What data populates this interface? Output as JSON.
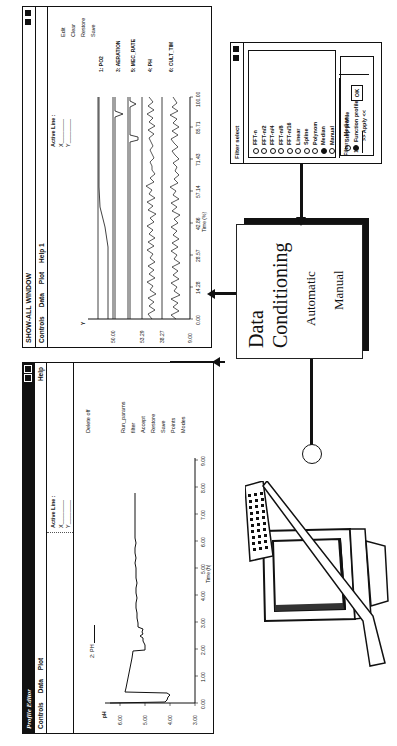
{
  "profile_editor": {
    "title": "Profile Editor",
    "menu": [
      "Controls",
      "Data",
      "Plot"
    ],
    "help": "Help",
    "trace_label": "2: PH",
    "active_line_label": "Active Line :",
    "x_label": "X",
    "y_label": "Y",
    "delete_label": "Delete off",
    "side_buttons": [
      "Run_params",
      "filter",
      "Accept",
      "Restore",
      "Save",
      "Points",
      "Modes"
    ],
    "y_axis_label": "pH",
    "y_ticks": [
      "3.00",
      "4.00",
      "5.00",
      "6.00"
    ],
    "x_ticks": [
      "0.00",
      "1.00",
      "2.00",
      "3.00",
      "4.00",
      "5.00",
      "6.00",
      "7.00",
      "8.00",
      "9.00"
    ],
    "x_axis_label": "Time (h)"
  },
  "show_all_window": {
    "title": "SHOW-ALL WINDOW",
    "menu": [
      "Controls",
      "Data",
      "Plot",
      "Help 1"
    ],
    "active_line_label": "Active Line :",
    "x_label": "X",
    "y_label": "Y",
    "side_buttons": [
      "Edit",
      "Clear",
      "Restore",
      "Save"
    ],
    "trace_labels": [
      "1: PO2",
      "3: AERATION",
      "5: MEC_RATE",
      "4: PH",
      "6: CULT_TIM"
    ],
    "y_ticks": [
      "9.00",
      "38.27",
      "53.29",
      "50.00"
    ],
    "x_ticks": [
      "0.00",
      "14.28",
      "28.57",
      "42.86",
      "57.14",
      "71.43",
      "85.71",
      "100.00"
    ],
    "x_axis_label": "Time (%)"
  },
  "filter_select": {
    "title": "Filter select",
    "options": [
      {
        "label": "FFT-n",
        "selected": false
      },
      {
        "label": "FFT-n/2",
        "selected": false
      },
      {
        "label": "FFT-n/4",
        "selected": false
      },
      {
        "label": "FFT-n/8",
        "selected": false
      },
      {
        "label": "FFT-n/16",
        "selected": false
      },
      {
        "label": "Linear",
        "selected": false
      },
      {
        "label": "Spline",
        "selected": false
      },
      {
        "label": "Polynom",
        "selected": false
      },
      {
        "label": "Median",
        "selected": true
      },
      {
        "label": "Manual",
        "selected": false
      }
    ],
    "filter_label": "Filter:",
    "filter_value": "Median",
    "input_value": "13",
    "ok_label": "OK",
    "profile_options": [
      {
        "label": "Step profile",
        "selected": false
      },
      {
        "label": "Function profile",
        "selected": true
      }
    ],
    "apply_label": ">> Apply <<"
  },
  "data_conditioning": {
    "title_line1": "Data",
    "title_line2": "Conditioning",
    "mode1": "Automatic",
    "mode2": "Manual"
  }
}
